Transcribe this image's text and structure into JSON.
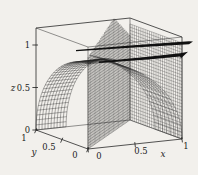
{
  "figure": {
    "background": "#f2f0ec",
    "ink": "#1c1c1c",
    "width": 198,
    "height": 175
  },
  "chart_data": {
    "type": "3d-surface",
    "title": "",
    "axes": {
      "x": {
        "label": "x",
        "range": [
          0,
          1
        ],
        "ticks": [
          0,
          0.5,
          1
        ],
        "tick_labels": [
          "0",
          "0.5",
          "1"
        ]
      },
      "y": {
        "label": "y",
        "range": [
          0,
          1
        ],
        "ticks": [
          0,
          0.5,
          1
        ],
        "tick_labels": [
          "0",
          "0.5",
          "1"
        ]
      },
      "z": {
        "label": "z",
        "range": [
          0,
          1
        ],
        "ticks": [
          0,
          0.5,
          1
        ],
        "tick_labels": [
          "0",
          "0.5",
          "1"
        ]
      }
    },
    "projection": {
      "origin": [
        88,
        149
      ],
      "ex": [
        94,
        -10
      ],
      "ey": [
        -52,
        -19
      ],
      "ez": [
        0,
        -85
      ],
      "box_zmax": 1.2
    },
    "box": {
      "edge_color": "#2a2a2a",
      "front_width": 0.8,
      "back_width": 0.5
    },
    "surfaces": [
      {
        "id": "cylinder-x2z2",
        "fn": "cyl_x",
        "u0": 0,
        "u1": 0.52,
        "us": 7,
        "phi1": 1.2661,
        "vs": 15,
        "stroke": "#3d3d3d",
        "w": 0.34
      },
      {
        "id": "right-face-mesh",
        "fn": "plane_x1",
        "ys": 24,
        "zt": 1.13,
        "zs": 30,
        "stroke": "#2f2f2f",
        "w": 0.3
      },
      {
        "id": "cylinder-y2z2",
        "fn": "cyl_y",
        "u0": 0,
        "u1": 0.32,
        "us": 10,
        "vs": 26,
        "stroke": "#262626",
        "w": 0.38
      },
      {
        "id": "diagonal-plane",
        "fn": "plane_diag",
        "ts": 33,
        "zs": 40,
        "top_left": 1.08,
        "top_peak": 1.33,
        "peak_t": 0.62,
        "top_right": 1.0,
        "stroke": "#161616",
        "w": 0.3
      }
    ],
    "ribbons": [
      {
        "id": "upper-intersection-ribbon",
        "pts": [
          [
            76,
            50
          ],
          [
            130,
            45.5
          ],
          [
            189,
            41.2
          ]
        ],
        "w": [
          1.2,
          2.2,
          3.0
        ],
        "tip": [
          [
            193,
            41.5
          ]
        ],
        "fill": "#101010"
      },
      {
        "id": "lower-intersection-ribbon",
        "pts": [
          [
            99,
            61.5
          ],
          [
            148,
            56.8
          ],
          [
            180,
            53.2
          ]
        ],
        "w": [
          1.5,
          2.6,
          3.4
        ],
        "tip": [
          [
            188,
            51.8
          ],
          [
            181,
            58.2
          ]
        ],
        "fill": "#101010"
      }
    ],
    "axis_render": [
      {
        "name": "x",
        "from": [
          0,
          0,
          0
        ],
        "to": [
          1,
          0,
          0
        ],
        "tick_dir": [
          0.4,
          3.4
        ],
        "label_offsets": [
          [
            11,
            10
          ],
          [
            6,
            10
          ],
          [
            4,
            10
          ]
        ],
        "anchor": "middle",
        "letter_pos": [
          163,
          157
        ]
      },
      {
        "name": "y",
        "from": [
          0,
          0,
          0
        ],
        "to": [
          0,
          1,
          0
        ],
        "tick_dir": [
          -1.4,
          3.2
        ],
        "label_offsets": [
          [
            -13,
            9
          ],
          [
            -13,
            10
          ],
          [
            -12,
            11
          ]
        ],
        "anchor": "middle",
        "letter_pos": [
          34,
          155
        ]
      },
      {
        "name": "z",
        "from": [
          0,
          1,
          0
        ],
        "to": [
          0,
          1,
          1
        ],
        "tick_dir": [
          -3.6,
          0
        ],
        "label_offsets": [
          [
            -6,
            3
          ],
          [
            -6,
            3
          ],
          [
            -6,
            3
          ]
        ],
        "anchor": "end",
        "letter_pos": [
          13,
          91
        ]
      }
    ]
  }
}
